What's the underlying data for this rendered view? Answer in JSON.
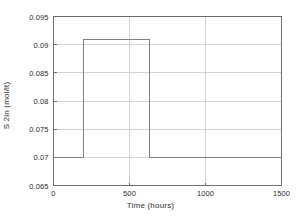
{
  "chart_data": {
    "type": "line",
    "title": "",
    "subtitle": "",
    "xlabel": "Time (hours)",
    "ylabel": "S 2in (mol/lt)",
    "xlim": [
      0,
      1500
    ],
    "ylim": [
      0.065,
      0.095
    ],
    "xticks": [
      0,
      500,
      1000,
      1500
    ],
    "xticklabels": [
      "0",
      "500",
      "1000",
      "1500"
    ],
    "yticks": [
      0.065,
      0.07,
      0.075,
      0.08,
      0.085,
      0.09,
      0.095
    ],
    "yticklabels": [
      "0.065",
      "0.07",
      "0.075",
      "0.08",
      "0.085",
      "0.09",
      "0.095"
    ],
    "grid": true,
    "grid_axis": "both",
    "legend": null,
    "legend_position": "none",
    "series": [
      {
        "name": "S 2in",
        "style": "step-post",
        "color": "#808080",
        "linewidth": 1,
        "x": [
          0,
          197,
          197,
          630,
          630,
          1500
        ],
        "y": [
          0.07,
          0.07,
          0.091,
          0.091,
          0.07,
          0.07
        ]
      }
    ],
    "annotations": [
      {
        "text": "baseline value",
        "value": 0.07
      },
      {
        "text": "pulse value",
        "value": 0.091
      },
      {
        "text": "pulse start (hours)",
        "value": 197
      },
      {
        "text": "pulse end (hours)",
        "value": 630
      }
    ],
    "colors": {
      "line": "#808080",
      "grid": "#c8c8c8",
      "axis": "#6e6e6e",
      "background": "#ffffff",
      "text": "#2b2b2b"
    }
  }
}
